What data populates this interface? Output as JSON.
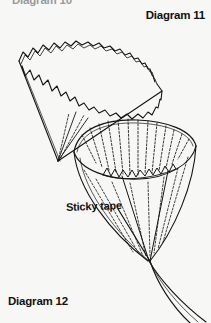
{
  "figure": {
    "kind": "line-art instructional craft diagram",
    "background_color": "#f7f7f5",
    "ink_color": "#141414",
    "width": 211,
    "height": 323
  },
  "labels": {
    "clipped_top": "Diagram 10",
    "diagram_11": "Diagram 11",
    "diagram_12": "Diagram 12",
    "sticky_tape": "Sticky tape"
  },
  "shapes": {
    "upper_cone": {
      "name": "paper cone with pinked zigzag rim",
      "apex": [
        58,
        161
      ],
      "far_rim_zigzag_teeth": 17,
      "near_rim_zigzag_teeth": 15,
      "fold_lines": 3
    },
    "lower_funnel": {
      "name": "pleated paper funnel with sticky tape seam",
      "rim_center": [
        135,
        146
      ],
      "rim_radius_x": 62,
      "rim_radius_y": 26,
      "pleat_lines": 19,
      "seam_zigzag_teeth": 16,
      "tail_tip": [
        205,
        322
      ]
    }
  }
}
